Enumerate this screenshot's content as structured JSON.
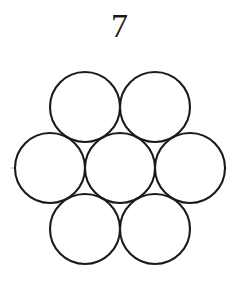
{
  "figure": {
    "title": "7",
    "caption_text": "7",
    "background_color": "#ffffff",
    "circle_stroke_color": "#1a1a1a",
    "circle_fill_color": "#ffffff",
    "centerline_color": "#b3b3b3",
    "centerline_style": "dash-dot"
  },
  "chart_data": {
    "type": "diagram",
    "title": "7",
    "unit_count": 7,
    "packing": "hexagonal",
    "radius": 35,
    "circles": [
      {
        "id": "center",
        "label": "center",
        "cx": 120,
        "cy": 168,
        "r": 35
      },
      {
        "id": "top-left",
        "label": "top left",
        "cx": 85,
        "cy": 107,
        "r": 35
      },
      {
        "id": "top-right",
        "label": "top right",
        "cx": 155,
        "cy": 107,
        "r": 35
      },
      {
        "id": "middle-left",
        "label": "middle left",
        "cx": 50,
        "cy": 168,
        "r": 35
      },
      {
        "id": "middle-right",
        "label": "middle right",
        "cx": 190,
        "cy": 168,
        "r": 35
      },
      {
        "id": "bottom-left",
        "label": "bottom left",
        "cx": 85,
        "cy": 229,
        "r": 35
      },
      {
        "id": "bottom-right",
        "label": "bottom right",
        "cx": 155,
        "cy": 229,
        "r": 35
      }
    ],
    "centerlines": [
      {
        "id": "axis-horizontal",
        "label": "horizontal axis",
        "x1": 11,
        "y1": 168,
        "x2": 229,
        "y2": 168
      },
      {
        "id": "axis-diag-up",
        "label": "diagonal axis 60deg",
        "x1": 58,
        "y1": 247,
        "x2": 182,
        "y2": 89
      },
      {
        "id": "axis-diag-down",
        "label": "diagonal axis -60deg",
        "x1": 58,
        "y1": 89,
        "x2": 182,
        "y2": 247
      }
    ]
  }
}
